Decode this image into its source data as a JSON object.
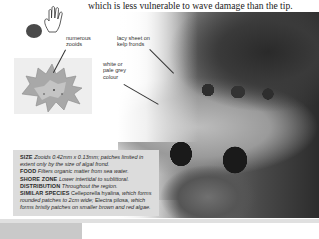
{
  "page": {
    "intro_text": "which is less vulnerable to wave damage than the tip.",
    "size_icons": {
      "blob": "actual-size-blob-icon",
      "hand": "hand-scale-icon"
    },
    "labels": {
      "numerous_zooids": "numerous zooids",
      "numerous_zooids_lines": [
        "numerous",
        "zooids"
      ],
      "lacy_sheet": [
        "lacy sheet on",
        "kelp fronds"
      ],
      "white_colour": [
        "white or",
        "pale grey",
        "colour"
      ]
    },
    "info": [
      {
        "key": "SIZE",
        "value": "Zooids 0.42mm x 0.13mm; patches limited in extent only by the size of algal frond."
      },
      {
        "key": "FOOD",
        "value": "Filters organic matter from sea water."
      },
      {
        "key": "SHORE ZONE",
        "value": "Lower intertidal to sublittoral."
      },
      {
        "key": "DISTRIBUTION",
        "value": "Throughout the region."
      },
      {
        "key": "SIMILAR SPECIES",
        "value_parts": [
          {
            "text": "Celleporella hyalina",
            "style": "normal"
          },
          {
            "text": ", which forms rounded patches to 2cm wide; ",
            "style": "italic"
          },
          {
            "text": "Electra pilosa",
            "style": "normal"
          },
          {
            "text": ", which forms bristly patches on smaller brown and red algae.",
            "style": "italic"
          }
        ]
      }
    ],
    "colors": {
      "info_bg": "#dcdcdc",
      "text": "#2a2a2a",
      "bottom_strip": "#c9c9c9"
    }
  }
}
